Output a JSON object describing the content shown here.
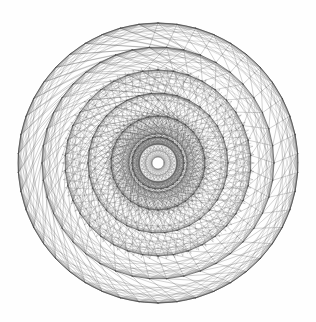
{
  "figure": {
    "title": "f(n)=fa",
    "caption_visible": true,
    "background_color": "#fefefe",
    "stroke_color": "#4a4a4a",
    "canvas_width": 316,
    "canvas_height": 322
  },
  "chart_data": {
    "type": "scatter",
    "title": "f(n)=fa",
    "subtitle": "",
    "xlabel": "",
    "ylabel": "",
    "plot_kind": "concentric-star-polygon-mandala",
    "center_x": 158,
    "center_y": 163,
    "outer_radius": 140,
    "center_void_radius": 6,
    "grid": false,
    "legend": "none",
    "axis_visible": false,
    "xlim": [
      18,
      298
    ],
    "ylim": [
      23,
      303
    ],
    "ring_count": 6,
    "rings": [
      {
        "index": 0,
        "radius": 140,
        "vertices": 46,
        "chord_steps": [
          1,
          2,
          3,
          5,
          7
        ]
      },
      {
        "index": 1,
        "radius": 116,
        "vertices": 42,
        "chord_steps": [
          1,
          2,
          3,
          5,
          7
        ]
      },
      {
        "index": 2,
        "radius": 93,
        "vertices": 38,
        "chord_steps": [
          1,
          2,
          3,
          5,
          7
        ]
      },
      {
        "index": 3,
        "radius": 70,
        "vertices": 34,
        "chord_steps": [
          1,
          2,
          3,
          5,
          9
        ]
      },
      {
        "index": 4,
        "radius": 47,
        "vertices": 30,
        "chord_steps": [
          1,
          2,
          3,
          7,
          11
        ]
      },
      {
        "index": 5,
        "radius": 26,
        "vertices": 26,
        "chord_steps": [
          1,
          2,
          3,
          5,
          9,
          11
        ]
      }
    ],
    "radial_spoke_count": 60,
    "radial_spoke_inner_radius": 6,
    "radial_spoke_outer_radius": 95,
    "star_polygon_inner": {
      "vertices": 60,
      "step": 23,
      "radius": 52
    },
    "star_polygon_dense": {
      "vertices": 72,
      "step": 29,
      "radius": 96
    },
    "linking_chords": [
      {
        "from_ring": 0,
        "to_ring": 1,
        "offset": 1
      },
      {
        "from_ring": 1,
        "to_ring": 2,
        "offset": 1
      },
      {
        "from_ring": 2,
        "to_ring": 3,
        "offset": 1
      },
      {
        "from_ring": 3,
        "to_ring": 4,
        "offset": 1
      },
      {
        "from_ring": 4,
        "to_ring": 5,
        "offset": 1
      }
    ],
    "values": [],
    "categories": []
  }
}
